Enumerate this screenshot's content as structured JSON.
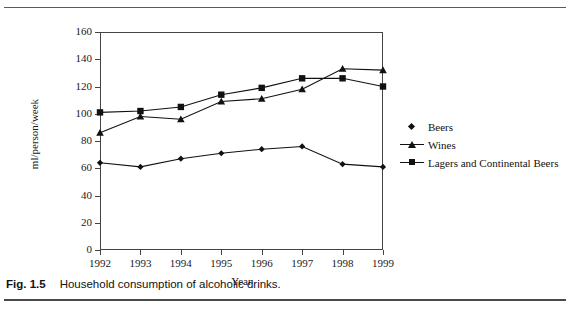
{
  "figure": {
    "caption_tag": "Fig. 1.5",
    "caption_text": "Household consumption of alcoholic drinks."
  },
  "chart_data": {
    "type": "line",
    "title": "",
    "xlabel": "Year",
    "ylabel": "ml/person/week",
    "categories": [
      "1992",
      "1993",
      "1994",
      "1995",
      "1996",
      "1997",
      "1998",
      "1999"
    ],
    "x": [
      1992,
      1993,
      1994,
      1995,
      1996,
      1997,
      1998,
      1999
    ],
    "ylim": [
      0,
      160
    ],
    "yticks": [
      0,
      20,
      40,
      60,
      80,
      100,
      120,
      140,
      160
    ],
    "grid": false,
    "legend_position": "right",
    "series": [
      {
        "name": "Beers",
        "marker": "diamond",
        "color": "#111111",
        "values": [
          64,
          61,
          67,
          71,
          74,
          76,
          63,
          61
        ]
      },
      {
        "name": "Wines",
        "marker": "triangle",
        "color": "#111111",
        "values": [
          86,
          98,
          96,
          109,
          111,
          118,
          133,
          132
        ]
      },
      {
        "name": "Lagers and Continental Beers",
        "marker": "square",
        "color": "#111111",
        "values": [
          101,
          102,
          105,
          114,
          119,
          126,
          126,
          120
        ]
      }
    ]
  }
}
